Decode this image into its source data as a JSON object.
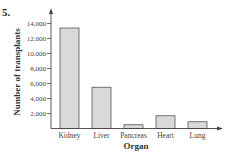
{
  "problem_number": "5.",
  "chart_data": {
    "type": "bar",
    "title": "",
    "xlabel": "Organ",
    "ylabel": "Number of transplants",
    "categories": [
      "Kidney",
      "Liver",
      "Pancreas",
      "Heart",
      "Lung"
    ],
    "values": [
      13400,
      5500,
      500,
      1700,
      900
    ],
    "yticks": [
      2000,
      4000,
      6000,
      8000,
      10000,
      12000,
      14000
    ],
    "ytick_labels": [
      "2,000",
      "4,000",
      "6,000",
      "8,000",
      "10,000",
      "12,000",
      "14,000"
    ],
    "ylim": [
      0,
      15000
    ],
    "grid": false,
    "legend": null,
    "bar_color": "#d9d9d9",
    "bar_edge_color": "#555555"
  }
}
